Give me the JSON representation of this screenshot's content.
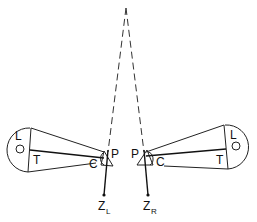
{
  "diagram": {
    "fixation_point": "apex",
    "left_eye": {
      "labels": {
        "lens": "L",
        "tube": "T",
        "cornea": "C",
        "pivot": "P"
      },
      "axis_label": "Z",
      "axis_subscript": "L"
    },
    "right_eye": {
      "labels": {
        "lens": "L",
        "tube": "T",
        "cornea": "C",
        "pivot": "P"
      },
      "axis_label": "Z",
      "axis_subscript": "R"
    },
    "colors": {
      "line": "#222222",
      "background": "#ffffff"
    }
  }
}
